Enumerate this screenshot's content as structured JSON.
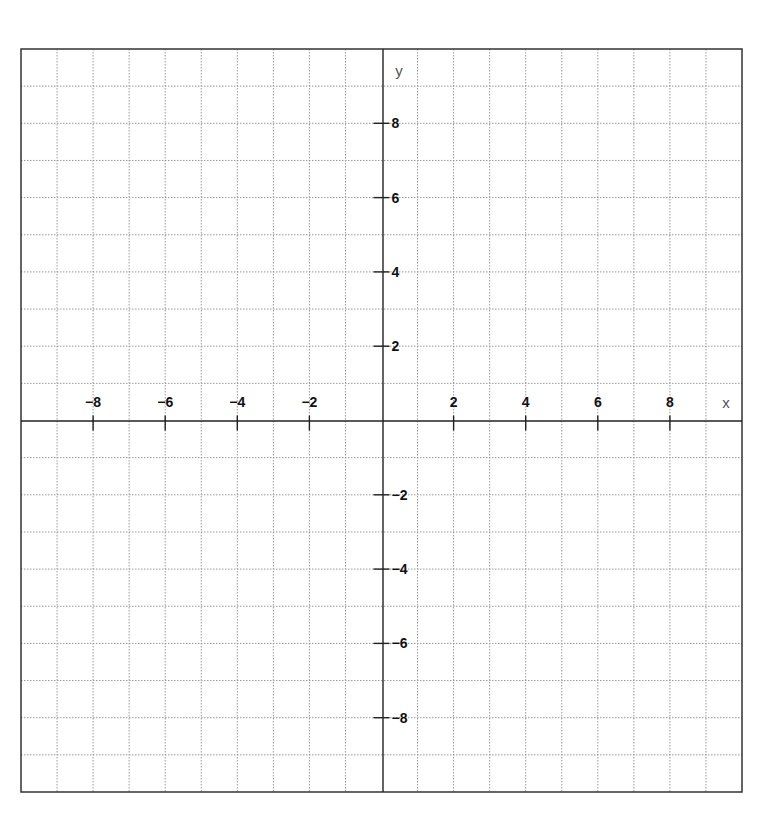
{
  "chart_data": {
    "type": "scatter",
    "title": "",
    "xlabel": "x",
    "ylabel": "y",
    "xlim": [
      -10,
      10
    ],
    "ylim": [
      -10,
      10
    ],
    "grid": true,
    "grid_step": 1,
    "x_ticks": [
      -8,
      -6,
      -4,
      -2,
      2,
      4,
      6,
      8
    ],
    "y_ticks": [
      8,
      6,
      4,
      2,
      -2,
      -4,
      -6,
      -8
    ],
    "x_tick_labels": [
      "−8",
      "−6",
      "−4",
      "−2",
      "2",
      "4",
      "6",
      "8"
    ],
    "y_tick_labels": [
      "8",
      "6",
      "4",
      "2",
      "−2",
      "−4",
      "−6",
      "−8"
    ],
    "series": [],
    "legend": null
  },
  "axes": {
    "x_label": "x",
    "y_label": "y"
  },
  "colors": {
    "border": "#333333",
    "axis": "#222222",
    "grid": "#9a9a9a",
    "text": "#111111"
  }
}
